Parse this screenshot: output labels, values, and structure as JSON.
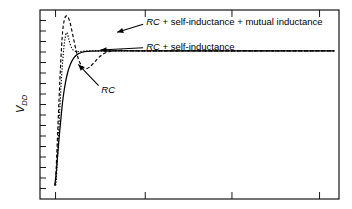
{
  "figure": {
    "name": "step-response-interconnect-models",
    "background": "#ffffff",
    "frame_color": "#000000"
  },
  "chart_data": {
    "type": "line",
    "title": "",
    "xlabel": "",
    "ylabel": "V_DD",
    "ylabel_display": "V",
    "ylabel_subscript": "DD",
    "grid": false,
    "legend_position": "inline-annotations",
    "xlim": [
      0,
      1
    ],
    "ylim": [
      0,
      1
    ],
    "axis_ticks": {
      "x_major_count": 4,
      "x_major_positions": [
        0.052,
        0.352,
        0.642,
        0.935
      ],
      "y_minor_count": 17,
      "tick_direction": "in",
      "tick_labels_shown": false
    },
    "steady_state_level": 0.78,
    "series": [
      {
        "name": "RC",
        "label": "RC",
        "style": "solid",
        "color": "#000000",
        "description": "Monotonic rising exponential, no overshoot, settles to Vdd",
        "points": [
          [
            0.048,
            0.075
          ],
          [
            0.05,
            0.08
          ],
          [
            0.055,
            0.15
          ],
          [
            0.06,
            0.25
          ],
          [
            0.066,
            0.36
          ],
          [
            0.072,
            0.46
          ],
          [
            0.078,
            0.545
          ],
          [
            0.085,
            0.615
          ],
          [
            0.093,
            0.672
          ],
          [
            0.102,
            0.714
          ],
          [
            0.112,
            0.744
          ],
          [
            0.124,
            0.764
          ],
          [
            0.138,
            0.775
          ],
          [
            0.155,
            0.781
          ],
          [
            0.175,
            0.783
          ],
          [
            0.2,
            0.784
          ],
          [
            0.24,
            0.784
          ],
          [
            0.3,
            0.784
          ],
          [
            0.4,
            0.784
          ],
          [
            0.5,
            0.784
          ],
          [
            0.7,
            0.784
          ],
          [
            0.9,
            0.784
          ],
          [
            0.985,
            0.784
          ]
        ]
      },
      {
        "name": "RC + self-inductance",
        "label": "RC + self-inductance",
        "style": "dotted",
        "color": "#000000",
        "description": "Faster rise with a modest single overshoot peak, then quick settle",
        "points": [
          [
            0.052,
            0.072
          ],
          [
            0.054,
            0.09
          ],
          [
            0.058,
            0.21
          ],
          [
            0.062,
            0.34
          ],
          [
            0.066,
            0.47
          ],
          [
            0.07,
            0.59
          ],
          [
            0.074,
            0.69
          ],
          [
            0.078,
            0.77
          ],
          [
            0.082,
            0.83
          ],
          [
            0.086,
            0.868
          ],
          [
            0.089,
            0.88
          ],
          [
            0.092,
            0.872
          ],
          [
            0.096,
            0.848
          ],
          [
            0.101,
            0.818
          ],
          [
            0.107,
            0.796
          ],
          [
            0.114,
            0.785
          ],
          [
            0.122,
            0.78
          ],
          [
            0.132,
            0.78
          ],
          [
            0.145,
            0.782
          ],
          [
            0.165,
            0.784
          ],
          [
            0.2,
            0.784
          ],
          [
            0.3,
            0.784
          ],
          [
            0.5,
            0.784
          ],
          [
            0.8,
            0.784
          ],
          [
            0.985,
            0.784
          ]
        ]
      },
      {
        "name": "RC + self-inductance + mutual inductance",
        "label": "RC + self-inductance + mutual inductance",
        "style": "dashed",
        "color": "#000000",
        "description": "Largest overshoot with a broad ringing peak followed by an undershoot dip before settling",
        "points": [
          [
            0.05,
            0.07
          ],
          [
            0.052,
            0.095
          ],
          [
            0.056,
            0.23
          ],
          [
            0.06,
            0.39
          ],
          [
            0.064,
            0.54
          ],
          [
            0.068,
            0.68
          ],
          [
            0.072,
            0.8
          ],
          [
            0.076,
            0.89
          ],
          [
            0.081,
            0.945
          ],
          [
            0.087,
            0.968
          ],
          [
            0.094,
            0.962
          ],
          [
            0.101,
            0.93
          ],
          [
            0.108,
            0.88
          ],
          [
            0.116,
            0.82
          ],
          [
            0.124,
            0.765
          ],
          [
            0.133,
            0.722
          ],
          [
            0.143,
            0.698
          ],
          [
            0.154,
            0.69
          ],
          [
            0.166,
            0.698
          ],
          [
            0.18,
            0.72
          ],
          [
            0.196,
            0.748
          ],
          [
            0.214,
            0.77
          ],
          [
            0.234,
            0.781
          ],
          [
            0.258,
            0.786
          ],
          [
            0.285,
            0.786
          ],
          [
            0.33,
            0.784
          ],
          [
            0.42,
            0.784
          ],
          [
            0.6,
            0.784
          ],
          [
            0.8,
            0.784
          ],
          [
            0.985,
            0.784
          ]
        ]
      }
    ],
    "annotations": [
      {
        "name": "annotation-mutual-inductance",
        "text": "RC + self-inductance + mutual inductance",
        "italic_prefix": "RC",
        "rest": " + self-inductance + mutual inductance",
        "text_x": 0.355,
        "text_y": 0.935,
        "arrow_from": [
          0.345,
          0.925
        ],
        "arrow_to": [
          0.258,
          0.882
        ]
      },
      {
        "name": "annotation-self-inductance",
        "text": "RC + self-inductance",
        "italic_prefix": "RC",
        "rest": " + self-inductance",
        "text_x": 0.355,
        "text_y": 0.805,
        "arrow_from": [
          0.345,
          0.8
        ],
        "arrow_to": [
          0.202,
          0.788
        ]
      },
      {
        "name": "annotation-rc",
        "text": "RC",
        "italic_prefix": "RC",
        "rest": "",
        "text_x": 0.205,
        "text_y": 0.575,
        "arrow_from": [
          0.196,
          0.6
        ],
        "arrow_to": [
          0.128,
          0.712
        ]
      }
    ]
  }
}
